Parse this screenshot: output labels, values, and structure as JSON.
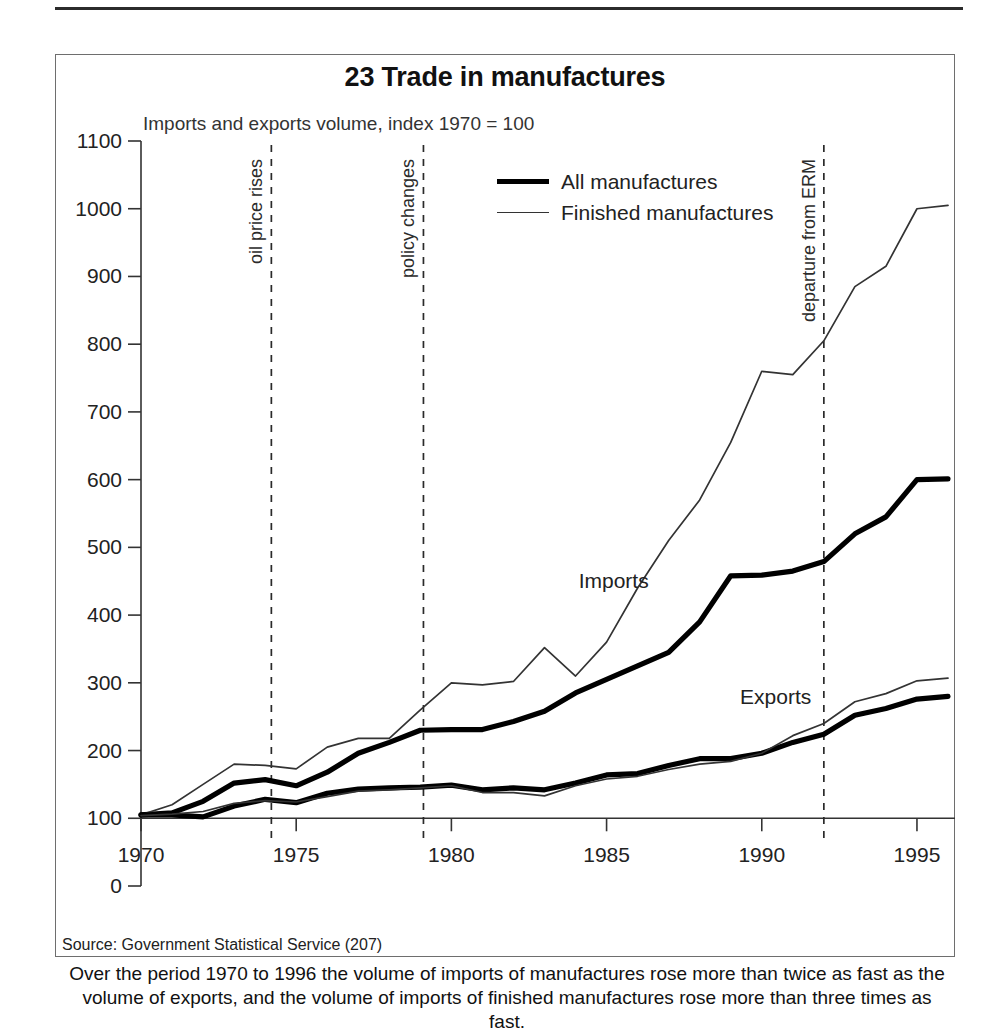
{
  "figure": {
    "title": "23 Trade in manufactures",
    "subtitle": "Imports and exports volume, index 1970 = 100",
    "source": "Source: Government Statistical Service (207)",
    "caption": "Over the period 1970 to 1996 the volume of imports of manufactures rose more than twice as fast as the volume of exports, and the volume of imports of finished manufactures rose more than three times as fast."
  },
  "legend": {
    "position": "top-center",
    "items": [
      {
        "label": "All manufactures",
        "style": "thick"
      },
      {
        "label": "Finished manufactures",
        "style": "thin"
      }
    ]
  },
  "annotations": {
    "inline": [
      {
        "text": "Imports",
        "x": 1984.1,
        "y": 440
      },
      {
        "text": "Exports",
        "x": 1989.3,
        "y": 268
      }
    ],
    "events": [
      {
        "text": "oil price rises",
        "year": 1974.2
      },
      {
        "text": "policy changes",
        "year": 1979.1
      },
      {
        "text": "departure from ERM",
        "year": 1992.0
      }
    ]
  },
  "chart_data": {
    "type": "line",
    "title": "23 Trade in manufactures",
    "subtitle": "Imports and exports volume, index 1970 = 100",
    "xlabel": "",
    "ylabel": "",
    "xlim": [
      1970,
      1996
    ],
    "ylim": [
      0,
      1100
    ],
    "ytick_step": 100,
    "yticks": [
      0,
      100,
      200,
      300,
      400,
      500,
      600,
      700,
      800,
      900,
      1000,
      1100
    ],
    "xticks": [
      1970,
      1975,
      1980,
      1985,
      1990,
      1995
    ],
    "grid": false,
    "x": [
      1970,
      1971,
      1972,
      1973,
      1974,
      1975,
      1976,
      1977,
      1978,
      1979,
      1980,
      1981,
      1982,
      1983,
      1984,
      1985,
      1986,
      1987,
      1988,
      1989,
      1990,
      1991,
      1992,
      1993,
      1994,
      1995,
      1996
    ],
    "series": [
      {
        "name": "Imports - All manufactures",
        "style": "thick",
        "values": [
          105,
          108,
          125,
          152,
          157,
          148,
          168,
          196,
          212,
          230,
          231,
          231,
          243,
          258,
          285,
          305,
          325,
          345,
          390,
          458,
          459,
          465,
          479,
          520,
          545,
          600,
          601
        ]
      },
      {
        "name": "Imports - Finished manufactures",
        "style": "thin",
        "values": [
          105,
          120,
          150,
          180,
          178,
          173,
          205,
          218,
          218,
          260,
          300,
          297,
          302,
          352,
          310,
          360,
          440,
          510,
          570,
          655,
          760,
          755,
          805,
          885,
          915,
          1000,
          1005
        ]
      },
      {
        "name": "Exports - All manufactures",
        "style": "thick",
        "values": [
          105,
          105,
          102,
          118,
          128,
          123,
          137,
          143,
          145,
          146,
          149,
          142,
          145,
          142,
          152,
          164,
          166,
          178,
          188,
          188,
          196,
          212,
          224,
          252,
          262,
          276,
          280
        ]
      },
      {
        "name": "Exports - Finished manufactures",
        "style": "thin",
        "values": [
          104,
          106,
          110,
          122,
          126,
          124,
          132,
          140,
          142,
          145,
          148,
          138,
          138,
          133,
          148,
          158,
          162,
          172,
          180,
          184,
          196,
          222,
          240,
          272,
          284,
          303,
          307
        ]
      }
    ]
  }
}
